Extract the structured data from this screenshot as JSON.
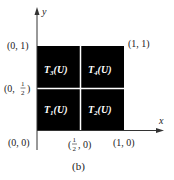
{
  "figure": {
    "caption": "(b)",
    "axes": {
      "x_label": "x",
      "y_label": "y"
    },
    "corner_labels": {
      "top_left": "(0, 1)",
      "top_right": "(1, 1)",
      "middle_left_prefix": "(0, ",
      "middle_left_num": "1",
      "middle_left_den": "2",
      "middle_left_suffix": ")",
      "bottom_left": "(0, 0)",
      "bottom_middle_prefix": "(",
      "bottom_middle_num": "1",
      "bottom_middle_den": "2",
      "bottom_middle_suffix": ", 0)",
      "bottom_right": "(1, 0)"
    },
    "cells": [
      {
        "id": "T3",
        "base": "T",
        "sub": "3",
        "arg": "(U)",
        "position": "top-left"
      },
      {
        "id": "T4",
        "base": "T",
        "sub": "4",
        "arg": "(U)",
        "position": "top-right"
      },
      {
        "id": "T1",
        "base": "T",
        "sub": "1",
        "arg": "(U)",
        "position": "bottom-left"
      },
      {
        "id": "T2",
        "base": "T",
        "sub": "2",
        "arg": "(U)",
        "position": "bottom-right"
      }
    ],
    "colors": {
      "fill": "#000000",
      "divider": "#ffffff",
      "axis": "#333333"
    }
  }
}
